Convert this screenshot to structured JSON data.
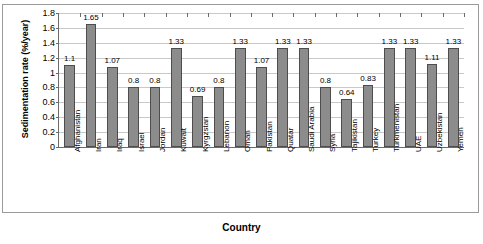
{
  "chart_data": {
    "type": "bar",
    "title": "",
    "xlabel": "Country",
    "ylabel": "Sedimentation rate (%/year)",
    "ylim": [
      0,
      1.8
    ],
    "ytick_step": 0.2,
    "yticks": [
      "0",
      "0.2",
      "0.4",
      "0.6",
      "0.8",
      "1",
      "1.2",
      "1.4",
      "1.6",
      "1.8"
    ],
    "grid": true,
    "legend": "none",
    "bar_color": "#8c8c8c",
    "bar_border_color": "#4d4d4d",
    "gridline_color": "#c9c9c9",
    "axis_color": "#6b6b6b",
    "categories": [
      "Afghanistan",
      "Iran",
      "Iraq",
      "Israel",
      "Jordan",
      "Kuwait",
      "Kyrgzstan",
      "Lebanon",
      "Oman",
      "Pakistan",
      "Quatar",
      "Saudi Arabia",
      "Syria",
      "Tajikistan",
      "Turkey",
      "Turkmenistan",
      "UAE",
      "Uzbekistan",
      "Yemen"
    ],
    "values": [
      1.1,
      1.65,
      1.07,
      0.8,
      0.8,
      1.33,
      0.69,
      0.8,
      1.33,
      1.07,
      1.33,
      1.33,
      0.8,
      0.64,
      0.83,
      1.33,
      1.33,
      1.11,
      1.33
    ],
    "value_labels": [
      "1.1",
      "1.65",
      "1.07",
      "0.8",
      "0.8",
      "1.33",
      "0.69",
      "0.8",
      "1.33",
      "1.07",
      "1.33",
      "1.33",
      "0.8",
      "0.64",
      "0.83",
      "1.33",
      "1.33",
      "1.11",
      "1.33"
    ]
  }
}
